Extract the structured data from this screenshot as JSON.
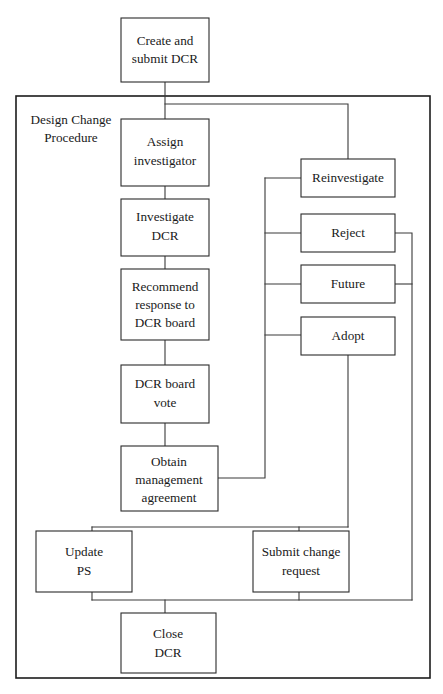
{
  "diagram": {
    "type": "flowchart",
    "title": "Design Change Procedure",
    "frame": {
      "label_line1": "Design Change",
      "label_line2": "Procedure"
    },
    "nodes": [
      {
        "id": "create_submit",
        "line1": "Create and",
        "line2": "submit DCR",
        "line3": ""
      },
      {
        "id": "assign_investigator",
        "line1": "Assign",
        "line2": "investigator",
        "line3": ""
      },
      {
        "id": "investigate_dcr",
        "line1": "Investigate",
        "line2": "DCR",
        "line3": ""
      },
      {
        "id": "recommend_response",
        "line1": "Recommend",
        "line2": "response to",
        "line3": "DCR board"
      },
      {
        "id": "dcr_board_vote",
        "line1": "DCR board",
        "line2": "vote",
        "line3": ""
      },
      {
        "id": "obtain_management",
        "line1": "Obtain",
        "line2": "management",
        "line3": "agreement"
      },
      {
        "id": "reinvestigate",
        "line1": "Reinvestigate",
        "line2": "",
        "line3": ""
      },
      {
        "id": "reject",
        "line1": "Reject",
        "line2": "",
        "line3": ""
      },
      {
        "id": "future",
        "line1": "Future",
        "line2": "",
        "line3": ""
      },
      {
        "id": "adopt",
        "line1": "Adopt",
        "line2": "",
        "line3": ""
      },
      {
        "id": "update_ps",
        "line1": "Update",
        "line2": "PS",
        "line3": ""
      },
      {
        "id": "submit_change_request",
        "line1": "Submit change",
        "line2": "request",
        "line3": ""
      },
      {
        "id": "close_dcr",
        "line1": "Close",
        "line2": "DCR",
        "line3": ""
      }
    ],
    "colors": {
      "background": "#ffffff",
      "box_stroke": "#2b2b2b",
      "frame_stroke": "#1c1c1c",
      "connector": "#3a3a3a",
      "text": "#1a1a1a"
    }
  }
}
